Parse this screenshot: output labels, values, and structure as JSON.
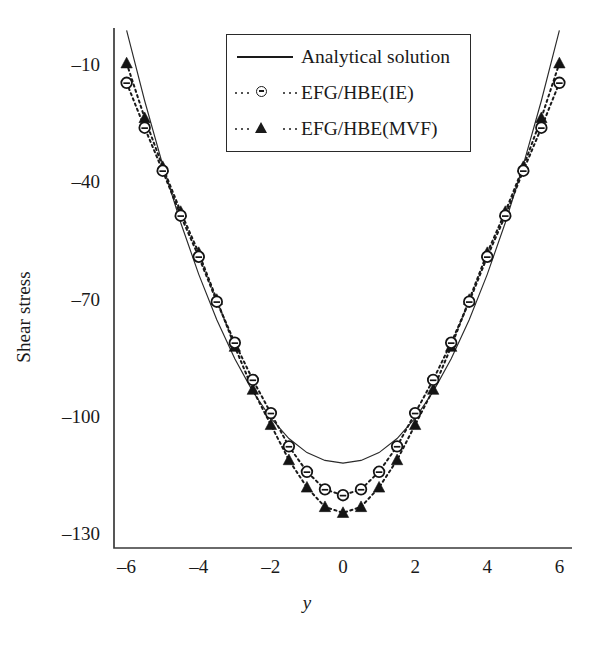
{
  "chart_data": {
    "type": "line",
    "title": "",
    "xlabel": "y",
    "ylabel": "Shear stress",
    "xlim": [
      -6.3,
      6.3
    ],
    "ylim": [
      -133,
      -0.5
    ],
    "xticks": [
      -6,
      -4,
      -2,
      0,
      2,
      4,
      6
    ],
    "xticklabels": [
      "–6",
      "–4",
      "–2",
      "0",
      "2",
      "4",
      "6"
    ],
    "yticks": [
      -10,
      -40,
      -70,
      -100,
      -130
    ],
    "yticklabels": [
      "–10",
      "–40",
      "–70",
      "–100",
      "–130"
    ],
    "grid": false,
    "legend_position": "upper center",
    "series": [
      {
        "name": "Analytical solution",
        "style": "solid-line",
        "marker": "none",
        "x": [
          -6.0,
          -5.5,
          -5.0,
          -4.5,
          -4.0,
          -3.5,
          -3.0,
          -2.5,
          -2.0,
          -1.5,
          -1.0,
          -0.5,
          0.0,
          0.5,
          1.0,
          1.5,
          2.0,
          2.5,
          3.0,
          3.5,
          4.0,
          4.5,
          5.0,
          5.5,
          6.0
        ],
        "y": [
          -0.6,
          -18.6,
          -35.0,
          -49.8,
          -63.0,
          -74.6,
          -84.6,
          -93.0,
          -99.8,
          -105.0,
          -108.6,
          -110.6,
          -111.3,
          -110.6,
          -108.6,
          -105.0,
          -99.8,
          -93.0,
          -84.6,
          -74.6,
          -63.0,
          -49.8,
          -35.0,
          -18.6,
          -0.6
        ]
      },
      {
        "name": "EFG/HBE(IE)",
        "style": "dotted-line",
        "marker": "open-circle",
        "x": [
          -6.0,
          -5.5,
          -5.0,
          -4.5,
          -4.0,
          -3.5,
          -3.0,
          -2.5,
          -2.0,
          -1.5,
          -1.0,
          -0.5,
          0.0,
          0.5,
          1.0,
          1.5,
          2.0,
          2.5,
          3.0,
          3.5,
          4.0,
          4.5,
          5.0,
          5.5,
          6.0
        ],
        "y": [
          -14.0,
          -25.5,
          -36.5,
          -48.0,
          -58.5,
          -70.0,
          -80.5,
          -90.0,
          -98.5,
          -107.0,
          -113.5,
          -118.0,
          -119.5,
          -118.0,
          -113.5,
          -107.0,
          -98.5,
          -90.0,
          -80.5,
          -70.0,
          -58.5,
          -48.0,
          -36.5,
          -25.5,
          -14.0
        ]
      },
      {
        "name": "EFG/HBE(MVF)",
        "style": "dotted-line",
        "marker": "filled-triangle",
        "x": [
          -6.0,
          -5.5,
          -5.0,
          -4.5,
          -4.0,
          -3.5,
          -3.0,
          -2.5,
          -2.0,
          -1.5,
          -1.0,
          -0.5,
          0.0,
          0.5,
          1.0,
          1.5,
          2.0,
          2.5,
          3.0,
          3.5,
          4.0,
          4.5,
          5.0,
          5.5,
          6.0
        ],
        "y": [
          -9.0,
          -23.0,
          -35.5,
          -47.0,
          -57.5,
          -69.5,
          -81.5,
          -92.5,
          -101.5,
          -110.5,
          -117.5,
          -122.5,
          -124.0,
          -122.5,
          -117.5,
          -110.5,
          -101.5,
          -92.5,
          -81.5,
          -69.5,
          -57.5,
          -47.0,
          -35.5,
          -23.0,
          -9.0
        ]
      }
    ]
  },
  "axes": {
    "ylabel": "Shear stress",
    "xlabel": "y"
  },
  "legend": {
    "entries": [
      {
        "label": "Analytical solution",
        "key": "solid-line-key"
      },
      {
        "label": "EFG/HBE(IE)",
        "key": "dotted-open-circle-key"
      },
      {
        "label": "EFG/HBE(MVF)",
        "key": "dotted-filled-triangle-key"
      }
    ]
  }
}
